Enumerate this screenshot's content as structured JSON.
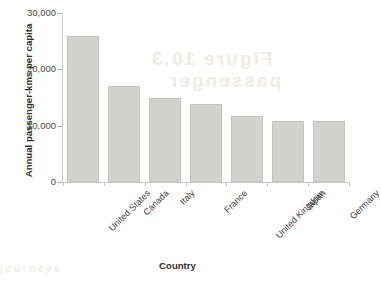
{
  "chart_data": {
    "type": "bar",
    "title": "",
    "subtitle": "",
    "xlabel": "Country",
    "ylabel": "Annual passenger-kms per capita",
    "categories": [
      "United States",
      "Canada",
      "Italy",
      "France",
      "United Kingdom",
      "Japan",
      "Germany"
    ],
    "values": [
      26000,
      17000,
      15000,
      13900,
      11800,
      10800,
      10800
    ],
    "series": [
      {
        "name": "Annual passenger-kms per capita",
        "values": [
          26000,
          17000,
          15000,
          13900,
          11800,
          10800,
          10800
        ]
      }
    ],
    "ylim": [
      0,
      30000
    ],
    "ytick_labels": [
      "30,000",
      "20,000",
      "10,000",
      "0"
    ],
    "ytick_values": [
      30000,
      20000,
      10000,
      0
    ],
    "grid": false,
    "legend": false,
    "legend_position": "none",
    "bar_fill_color": "#d2d2ce",
    "bar_border_color": "#c3c3bf",
    "axis_color": "#c9c9c9",
    "text_color": "#3a3a3a",
    "background_color": "#ffffff"
  },
  "artifacts": {
    "bleed_1": "Figure 10.3",
    "bleed_2": "passenger",
    "bleed_3": "journeys"
  }
}
